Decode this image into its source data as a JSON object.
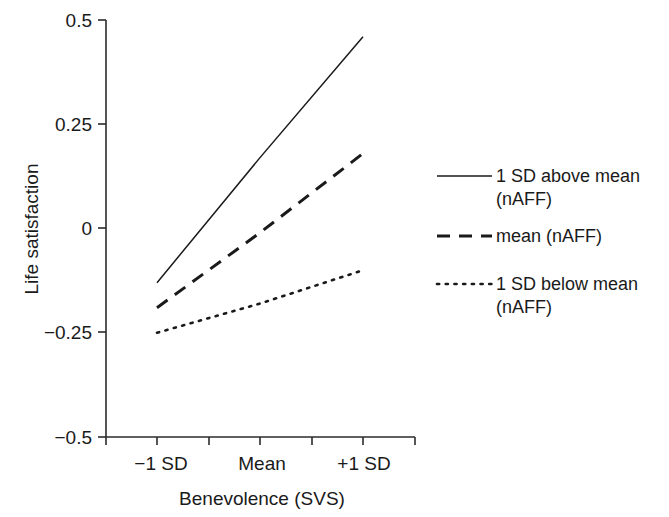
{
  "figure": {
    "background_color": "#ffffff",
    "line_color": "#1a1a1a",
    "axis_color": "#2b2b2b"
  },
  "axes": {
    "y_title": "Life satisfaction",
    "x_title": "Benevolence (SVS)",
    "y_ticks": [
      "0.5",
      "0.25",
      "0",
      "−0.25",
      "−0.5"
    ],
    "x_ticks": [
      "−1 SD",
      "Mean",
      "+1 SD"
    ]
  },
  "legend": {
    "items": [
      {
        "label_line1": "1 SD above mean",
        "label_line2": "(nAFF)",
        "style": "solid",
        "swatch_name": "legend-swatch-solid"
      },
      {
        "label_line1": "mean (nAFF)",
        "label_line2": "",
        "style": "dashed",
        "swatch_name": "legend-swatch-dashed"
      },
      {
        "label_line1": "1 SD below mean",
        "label_line2": "(nAFF)",
        "style": "dotted",
        "swatch_name": "legend-swatch-dotted"
      }
    ]
  },
  "chart_data": {
    "type": "line",
    "title": "",
    "xlabel": "Benevolence (SVS)",
    "ylabel": "Life satisfaction",
    "x": [
      "−1 SD",
      "Mean",
      "+1 SD"
    ],
    "x_numeric": [
      -1,
      0,
      1
    ],
    "ylim": [
      -0.5,
      0.5
    ],
    "xlim": [
      -1.5,
      1.5
    ],
    "y_ticks": [
      0.5,
      0.25,
      0,
      -0.25,
      -0.5
    ],
    "grid": false,
    "legend_position": "right",
    "series": [
      {
        "name": "1 SD above mean (nAFF)",
        "style": "solid",
        "values": [
          -0.13,
          0.17,
          0.46
        ]
      },
      {
        "name": "mean (nAFF)",
        "style": "dashed",
        "values": [
          -0.19,
          -0.01,
          0.18
        ]
      },
      {
        "name": "1 SD below mean (nAFF)",
        "style": "dotted",
        "values": [
          -0.25,
          -0.18,
          -0.1
        ]
      }
    ]
  }
}
